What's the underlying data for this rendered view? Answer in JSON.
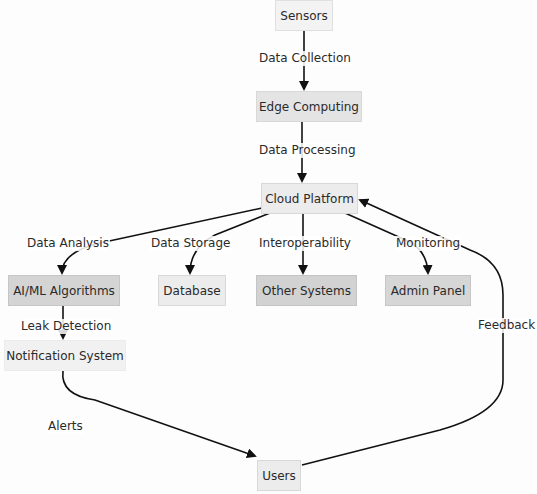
{
  "diagram": {
    "nodes": {
      "sensors": "Sensors",
      "edge": "Edge Computing",
      "cloud": "Cloud Platform",
      "aiml": "AI/ML Algorithms",
      "database": "Database",
      "other": "Other Systems",
      "admin": "Admin Panel",
      "notification": "Notification System",
      "users": "Users"
    },
    "edges": {
      "data_collection": "Data Collection",
      "data_processing": "Data Processing",
      "data_analysis": "Data Analysis",
      "data_storage": "Data Storage",
      "interoperability": "Interoperability",
      "monitoring": "Monitoring",
      "leak_detection": "Leak Detection",
      "alerts": "Alerts",
      "feedback": "Feedback"
    },
    "colors": {
      "line": "#111111",
      "node_light": "#f2f2f2",
      "node_mid": "#e6e6e6",
      "node_dark": "#d3d3d3"
    }
  }
}
